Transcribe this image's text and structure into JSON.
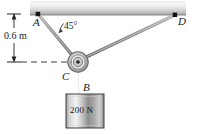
{
  "figure": {
    "points": {
      "a": "A",
      "b": "B",
      "c": "C",
      "d": "D"
    },
    "angle": "45°",
    "dimension": "0.6 m",
    "weight": "200 N",
    "colors": {
      "cable": "#8a8a8a",
      "bar_light": "#f2f2f2",
      "bar_dark": "#b4b4b4",
      "block_light": "#f4f4f4",
      "block_dark": "#777777",
      "ink": "#1a1a1a",
      "dashed": "#4a4a4a"
    },
    "geometry": {
      "bar": {
        "x": 30,
        "y": 2,
        "width": 156,
        "height": 13
      },
      "point_a": {
        "x": 38,
        "y": 14
      },
      "point_d": {
        "x": 175,
        "y": 15
      },
      "pulley": {
        "x": 78,
        "y": 62,
        "radius": 10
      },
      "block": {
        "x": 66,
        "y": 94,
        "width": 38,
        "height": 34
      },
      "dimension_line_x": 14,
      "dimension_top_y": 14,
      "dimension_bottom_y": 62
    }
  }
}
